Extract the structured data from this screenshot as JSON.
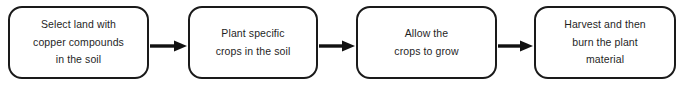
{
  "diagram": {
    "background_color": "#ffffff",
    "box_border_color": "#1a1a1a",
    "text_color": "#1f1f1f",
    "arrow_color": "#111111",
    "steps": [
      {
        "order": "1",
        "label": "Select land with\ncopper compounds\nin the soil"
      },
      {
        "order": "2",
        "label": "Plant specific\ncrops in the soil"
      },
      {
        "order": "3",
        "label": "Allow the\ncrops to grow"
      },
      {
        "order": "4",
        "label": "Harvest and then\nburn the plant\nmaterial"
      }
    ],
    "connectors": [
      {
        "from": "1",
        "to": "2",
        "icon": "arrow-right-icon"
      },
      {
        "from": "2",
        "to": "3",
        "icon": "arrow-right-icon"
      },
      {
        "from": "3",
        "to": "4",
        "icon": "arrow-right-icon"
      }
    ]
  }
}
